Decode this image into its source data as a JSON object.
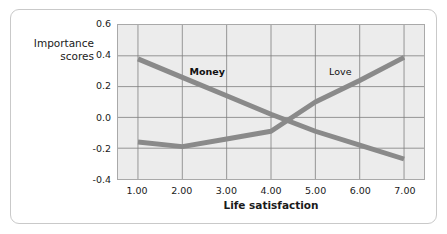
{
  "figure": {
    "background_color": "#ffffff",
    "frame_border_color": "#c9c9c9",
    "plot_background_color": "#ececec",
    "plot_border_color": "#a9a9a9",
    "gridline_color": "#7d7d7d",
    "line_color": "#8a8a8a"
  },
  "chart_data": {
    "type": "line",
    "title": "",
    "subtitle": "",
    "xlabel": "Life satisfaction",
    "ylabel": "Importance scores",
    "ylabel_lines": [
      "Importance",
      "scores"
    ],
    "xlim": [
      0.55,
      7.45
    ],
    "ylim": [
      -0.4,
      0.6
    ],
    "x": [
      1,
      2,
      3,
      4,
      5,
      6,
      7
    ],
    "xticks": [
      1,
      2,
      3,
      4,
      5,
      6,
      7
    ],
    "xtick_labels": [
      "1.00",
      "2.00",
      "3.00",
      "4.00",
      "5.00",
      "6.00",
      "7.00"
    ],
    "yticks": [
      0.6,
      0.4,
      0.2,
      0.0,
      -0.2,
      -0.4
    ],
    "ytick_labels": [
      "0.6",
      "0.4",
      "0.2",
      "0.0",
      "-0.2",
      "-0.4"
    ],
    "grid": true,
    "grid_axis": "both",
    "legend": "inline-annotations",
    "legend_position": "in-plot",
    "series": [
      {
        "name": "Money",
        "values": [
          0.38,
          0.26,
          0.14,
          0.02,
          -0.09,
          -0.18,
          -0.27
        ],
        "label_x": 2.55,
        "label_y": 0.305,
        "label_bold": true
      },
      {
        "name": "Love",
        "values": [
          -0.16,
          -0.19,
          -0.14,
          -0.09,
          0.1,
          0.24,
          0.39
        ],
        "label_x": 5.53,
        "label_y": 0.305,
        "label_bold": false
      }
    ],
    "annotations": [
      {
        "text": "Money",
        "x": 2.55,
        "y": 0.305
      },
      {
        "text": "Love",
        "x": 5.53,
        "y": 0.305
      }
    ]
  }
}
